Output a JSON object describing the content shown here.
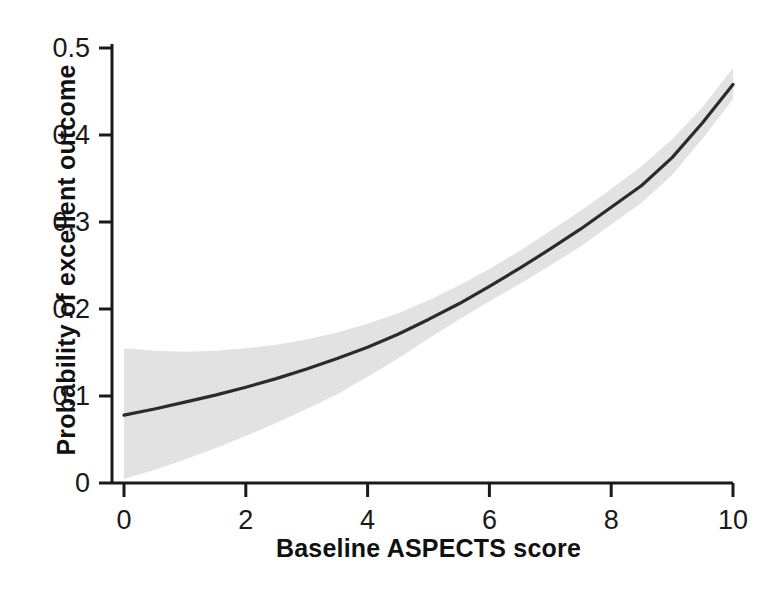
{
  "chart_data": {
    "type": "line",
    "title": "",
    "xlabel": "Baseline ASPECTS score",
    "ylabel": "Probability of excellent outcome",
    "xlim": [
      0,
      10
    ],
    "ylim": [
      0,
      0.5
    ],
    "grid": false,
    "legend": "none",
    "xticks": [
      "0",
      "2",
      "4",
      "6",
      "8",
      "10"
    ],
    "xtick_values": [
      0,
      2,
      4,
      6,
      8,
      10
    ],
    "yticks": [
      "0",
      "0.1",
      "0.2",
      "0.3",
      "0.4",
      "0.5"
    ],
    "ytick_values": [
      0,
      0.1,
      0.2,
      0.3,
      0.4,
      0.5
    ],
    "x": [
      0,
      0.5,
      1,
      1.5,
      2,
      2.5,
      3,
      3.5,
      4,
      4.5,
      5,
      5.5,
      6,
      6.5,
      7,
      7.5,
      8,
      8.5,
      9,
      9.5,
      10
    ],
    "series": [
      {
        "name": "Predicted probability of excellent outcome",
        "style": "solid-line",
        "color": "#2b2b2b",
        "values": [
          0.078,
          0.085,
          0.093,
          0.101,
          0.11,
          0.12,
          0.131,
          0.143,
          0.156,
          0.171,
          0.188,
          0.206,
          0.226,
          0.247,
          0.269,
          0.292,
          0.317,
          0.342,
          0.374,
          0.414,
          0.458
        ]
      }
    ],
    "confidence_band": {
      "name": "95% confidence interval",
      "color": "#e2e2e2",
      "upper": [
        0.155,
        0.152,
        0.151,
        0.152,
        0.155,
        0.159,
        0.165,
        0.173,
        0.183,
        0.195,
        0.21,
        0.227,
        0.246,
        0.267,
        0.29,
        0.313,
        0.338,
        0.364,
        0.395,
        0.432,
        0.477
      ],
      "lower": [
        0.005,
        0.015,
        0.027,
        0.04,
        0.054,
        0.069,
        0.085,
        0.102,
        0.122,
        0.143,
        0.166,
        0.188,
        0.209,
        0.229,
        0.25,
        0.272,
        0.297,
        0.322,
        0.354,
        0.396,
        0.441
      ]
    },
    "axis_color": "#1a1a1a",
    "background_color": "#ffffff"
  },
  "axes": {
    "y_title": "Probability of excellent outcome",
    "x_title": "Baseline ASPECTS score"
  }
}
